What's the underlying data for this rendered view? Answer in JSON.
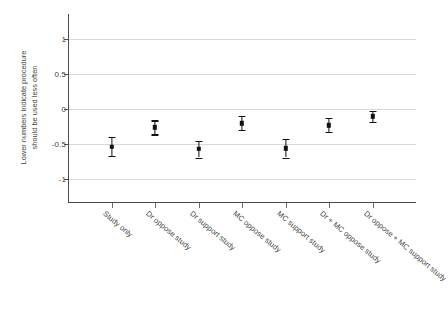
{
  "chart_data": {
    "type": "scatter",
    "title": "",
    "subtitle": "",
    "xlabel": "",
    "ylabel_lines": [
      "Lower numbers indicate procedure",
      "should be used less often"
    ],
    "ylabel": "Lower numbers indicate procedure should be used less often",
    "ylim": [
      -1.35,
      1.35
    ],
    "yticks": [
      1,
      0.5,
      0,
      -0.5,
      -1
    ],
    "ytick_labels": [
      "1",
      "0.5",
      "0",
      "-0.5",
      "-1"
    ],
    "grid": true,
    "legend": "none",
    "error_bar_type": "confidence-interval",
    "categories": [
      "Study only",
      "Dr oppose study",
      "Dr support study",
      "MC oppose study",
      "MC support study",
      "Dr + MC oppose study",
      "Dr oppose + MC support study"
    ],
    "values": [
      -0.55,
      -0.27,
      -0.58,
      -0.21,
      -0.57,
      -0.24,
      -0.11
    ],
    "error_low": [
      -0.68,
      -0.37,
      -0.7,
      -0.31,
      -0.7,
      -0.33,
      -0.19
    ],
    "error_high": [
      -0.41,
      -0.17,
      -0.46,
      -0.11,
      -0.44,
      -0.14,
      -0.04
    ],
    "marker_color": "#111111",
    "grid_color": "#d8d8d8",
    "axis_color": "#4a4a4a",
    "background_color": "#ffffff"
  }
}
